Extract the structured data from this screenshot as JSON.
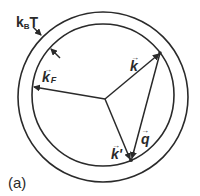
{
  "diagram": {
    "labels": {
      "thermal_shell": "k",
      "thermal_shell_sub": "B",
      "thermal_shell_T": "T",
      "fermi_vector": "k",
      "fermi_vector_sub": "F",
      "initial_vector": "k",
      "final_vector": "k'",
      "transfer_vector": "q",
      "vector_arrow": "→",
      "panel": "(a)"
    },
    "colors": {
      "line": "#2a2a2a",
      "background": "#ffffff"
    },
    "geometry": {
      "outer_circle": {
        "cx": 103,
        "cy": 97,
        "r": 85
      },
      "inner_circle": {
        "cx": 103,
        "cy": 95,
        "r": 71
      },
      "origin": [
        105,
        99
      ],
      "k_tip": [
        160,
        53
      ],
      "k_prime_tip": [
        131,
        160
      ],
      "kF_tip": [
        33,
        87
      ]
    }
  }
}
